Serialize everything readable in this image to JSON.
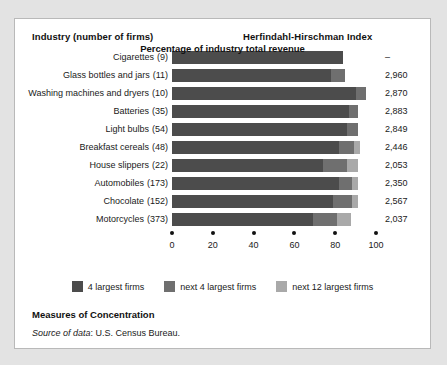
{
  "header": {
    "industry_label": "Industry (number of firms)",
    "hhi_label": "Herfindahl-Hirschman Index"
  },
  "footer": {
    "title": "Measures of Concentration",
    "source_prefix": "Source of data",
    "source_text": ": U.S. Census Bureau."
  },
  "chart_data": {
    "type": "bar",
    "orientation": "horizontal",
    "stacked": true,
    "title": "Measures of Concentration",
    "xlabel": "Percentage of industry total revenue",
    "ylabel": "Industry (number of firms)",
    "xlim": [
      0,
      100
    ],
    "grid": false,
    "legend_position": "bottom",
    "ticks": [
      0,
      20,
      40,
      60,
      80,
      100
    ],
    "tick_labels": [
      "0",
      "20",
      "40",
      "60",
      "80",
      "100"
    ],
    "legend": [
      "4 largest firms",
      "next 4 largest firms",
      "next 12 largest firms"
    ],
    "series": [
      {
        "name": "4 largest firms",
        "color": "#4c4c4c",
        "values": [
          84,
          78,
          90,
          87,
          86,
          82,
          74,
          82,
          79,
          69
        ]
      },
      {
        "name": "next 4 largest firms",
        "color": "#6f6f6f",
        "values": [
          0,
          7,
          5,
          4,
          5,
          7,
          12,
          6,
          9,
          12
        ]
      },
      {
        "name": "next 12 largest firms",
        "color": "#a9a9a9",
        "values": [
          0,
          0,
          0,
          0,
          0,
          3,
          5,
          3,
          3,
          7
        ]
      }
    ],
    "categories": [
      "Cigarettes",
      "Glass bottles and jars",
      "Washing machines and dryers",
      "Batteries",
      "Light bulbs",
      "Breakfast cereals",
      "House slippers",
      "Automobiles",
      "Chocolate",
      "Motorcycles"
    ],
    "rows": [
      {
        "industry": "Cigarettes",
        "firms": "(9)",
        "hhi": "–",
        "s1": 84,
        "s2": 0,
        "s3": 0
      },
      {
        "industry": "Glass bottles and jars",
        "firms": "(11)",
        "hhi": "2,960",
        "s1": 78,
        "s2": 7,
        "s3": 0
      },
      {
        "industry": "Washing machines and dryers",
        "firms": "(10)",
        "hhi": "2,870",
        "s1": 90,
        "s2": 5,
        "s3": 0
      },
      {
        "industry": "Batteries",
        "firms": "(35)",
        "hhi": "2,883",
        "s1": 87,
        "s2": 4,
        "s3": 0
      },
      {
        "industry": "Light bulbs",
        "firms": "(54)",
        "hhi": "2,849",
        "s1": 86,
        "s2": 5,
        "s3": 0
      },
      {
        "industry": "Breakfast cereals",
        "firms": "(48)",
        "hhi": "2,446",
        "s1": 82,
        "s2": 7,
        "s3": 3
      },
      {
        "industry": "House slippers",
        "firms": "(22)",
        "hhi": "2,053",
        "s1": 74,
        "s2": 12,
        "s3": 5
      },
      {
        "industry": "Automobiles",
        "firms": "(173)",
        "hhi": "2,350",
        "s1": 82,
        "s2": 6,
        "s3": 3
      },
      {
        "industry": "Chocolate",
        "firms": "(152)",
        "hhi": "2,567",
        "s1": 79,
        "s2": 9,
        "s3": 3
      },
      {
        "industry": "Motorcycles",
        "firms": "(373)",
        "hhi": "2,037",
        "s1": 69,
        "s2": 12,
        "s3": 7
      }
    ]
  }
}
